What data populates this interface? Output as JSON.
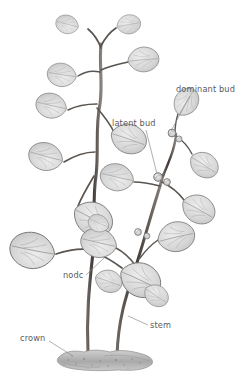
{
  "figure": {
    "background_color": "#ffffff",
    "ink_color": "#4a4a4a",
    "leaf_fill": "#d9d9d9",
    "leaf_outline": "#6e6e6e",
    "stem_color": "#4f4a47",
    "label_color": "#5a5a5a",
    "leader_color": "#8c8c8c",
    "crown_color": "#b5b5b5"
  },
  "labels": [
    {
      "id": "dominant-bud",
      "text": "dominant bud",
      "text_x": 176,
      "text_y": 92,
      "anchor": "start",
      "leader": "M 190 96 L 171 131",
      "points_to": "apical bud at tip of right-hand branch"
    },
    {
      "id": "latent-bud",
      "text": "latent bud",
      "text_x": 112,
      "text_y": 126,
      "anchor": "start",
      "leader": "M 146 130 L 157 174",
      "points_to": "small rounded axillary bud on stem node"
    },
    {
      "id": "node",
      "text": "nodc",
      "text_x": 63,
      "text_y": 278,
      "anchor": "start",
      "leader": "M 86 275 L 104 258",
      "points_to": "stem junction where leaves attach"
    },
    {
      "id": "stem",
      "text": "stem",
      "text_x": 150,
      "text_y": 328,
      "anchor": "start",
      "leader": "M 148 325 L 128 316",
      "points_to": "main upright shoot of right plant"
    },
    {
      "id": "crown",
      "text": "crown",
      "text_x": 20,
      "text_y": 341,
      "anchor": "start",
      "leader": "M 49 341 L 73 356",
      "points_to": "soil-level base where stems emerge"
    }
  ],
  "structures": {
    "stems": [
      {
        "id": "left-stem",
        "description": "tall left shoot rising from crown to apex"
      },
      {
        "id": "right-stem",
        "description": "shorter right shoot branching to dominant bud"
      }
    ],
    "leaf_count_visible": 22,
    "bud_count_visible": 5,
    "crown": {
      "description": "speckled grey soil mound at base",
      "x": 58,
      "y": 352,
      "width": 96,
      "height": 18
    }
  }
}
